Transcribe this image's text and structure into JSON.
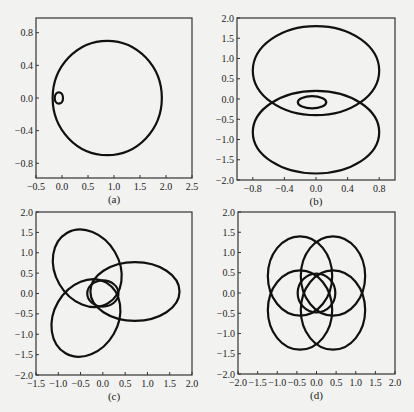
{
  "chart_data": [
    {
      "panel": "(a)",
      "type": "line",
      "title": "",
      "xlabel": "(a)",
      "ylabel": "",
      "xlim": [
        -0.5,
        2.5
      ],
      "ylim": [
        -0.98,
        0.98
      ],
      "xticks": [
        "-0.5",
        "0.0",
        "0.5",
        "1.0",
        "1.5",
        "2.0",
        "2.5"
      ],
      "yticks": [
        "0.8",
        "0.4",
        "0.0",
        "-0.4",
        "-0.8"
      ],
      "grid": false,
      "box": {
        "left": 36,
        "top": 18,
        "right": 192,
        "bottom": 178
      },
      "curves": [
        {
          "name": "outer-loop",
          "shape": "ellipse",
          "cx": 0.87,
          "cy": 0.0,
          "rx": 1.05,
          "ry": 0.7
        },
        {
          "name": "inner-loop",
          "shape": "ellipse",
          "cx": -0.06,
          "cy": 0.0,
          "rx": 0.08,
          "ry": 0.07
        }
      ]
    },
    {
      "panel": "(b)",
      "type": "line",
      "title": "",
      "xlabel": "(b)",
      "ylabel": "",
      "xlim": [
        -1.0,
        1.0
      ],
      "ylim": [
        -2.0,
        2.0
      ],
      "xticks": [
        "-0.8",
        "-0.4",
        "0.0",
        "0.4",
        "0.8"
      ],
      "yticks": [
        "2.0",
        "1.5",
        "1.0",
        "0.5",
        "0.0",
        "-0.5",
        "-1.0",
        "-1.5",
        "-2.0"
      ],
      "grid": false,
      "box": {
        "left": 237,
        "top": 18,
        "right": 395,
        "bottom": 180
      },
      "curves": [
        {
          "name": "upper-lobe",
          "shape": "ellipse",
          "cx": 0.0,
          "cy": 0.7,
          "rx": 0.8,
          "ry": 1.1
        },
        {
          "name": "lower-lobe",
          "shape": "ellipse",
          "cx": 0.0,
          "cy": -0.82,
          "rx": 0.8,
          "ry": 1.02
        },
        {
          "name": "inner-loop",
          "shape": "ellipse",
          "cx": -0.05,
          "cy": -0.08,
          "rx": 0.18,
          "ry": 0.15
        }
      ]
    },
    {
      "panel": "(c)",
      "type": "line",
      "title": "",
      "xlabel": "(c)",
      "ylabel": "",
      "xlim": [
        -1.5,
        2.0
      ],
      "ylim": [
        -2.0,
        2.0
      ],
      "xticks": [
        "-1.5",
        "-1.0",
        "-0.5",
        "0.0",
        "0.5",
        "1.0",
        "1.5",
        "2.0"
      ],
      "yticks": [
        "2.0",
        "1.5",
        "1.0",
        "0.5",
        "0.0",
        "-0.5",
        "-1.0",
        "-1.5",
        "-2.0"
      ],
      "grid": false,
      "box": {
        "left": 36,
        "top": 212,
        "right": 192,
        "bottom": 375
      },
      "curves": [
        {
          "name": "lobe-upper-left",
          "shape": "ellipse",
          "cx": -0.35,
          "cy": 0.62,
          "rx": 0.72,
          "ry": 1.0,
          "rotate": -30
        },
        {
          "name": "lobe-right",
          "shape": "ellipse",
          "cx": 0.72,
          "cy": 0.05,
          "rx": 1.0,
          "ry": 0.72,
          "rotate": 0
        },
        {
          "name": "lobe-lower-left",
          "shape": "ellipse",
          "cx": -0.38,
          "cy": -0.6,
          "rx": 0.72,
          "ry": 1.0,
          "rotate": 30
        },
        {
          "name": "inner-loop",
          "shape": "ellipse",
          "cx": 0.0,
          "cy": 0.0,
          "rx": 0.35,
          "ry": 0.32
        }
      ]
    },
    {
      "panel": "(d)",
      "type": "line",
      "title": "",
      "xlabel": "(d)",
      "ylabel": "",
      "xlim": [
        -2.0,
        2.0
      ],
      "ylim": [
        -2.0,
        2.0
      ],
      "xticks": [
        "-2.0",
        "-1.5",
        "-1.0",
        "-0.5",
        "0.0",
        "0.5",
        "1.0",
        "1.5",
        "2.0"
      ],
      "yticks": [
        "2.0",
        "1.5",
        "1.0",
        "0.5",
        "0.0",
        "-0.5",
        "-1.0",
        "-1.5",
        "-2.0"
      ],
      "grid": false,
      "box": {
        "left": 238,
        "top": 212,
        "right": 395,
        "bottom": 374
      },
      "curves": [
        {
          "name": "lobe-upper-left",
          "shape": "ellipse",
          "cx": -0.42,
          "cy": 0.42,
          "rx": 0.82,
          "ry": 0.98,
          "rotate": 0
        },
        {
          "name": "lobe-upper-right",
          "shape": "ellipse",
          "cx": 0.42,
          "cy": 0.42,
          "rx": 0.82,
          "ry": 0.98,
          "rotate": 0
        },
        {
          "name": "lobe-lower-left",
          "shape": "ellipse",
          "cx": -0.42,
          "cy": -0.42,
          "rx": 0.82,
          "ry": 0.98,
          "rotate": 0
        },
        {
          "name": "lobe-lower-right",
          "shape": "ellipse",
          "cx": 0.42,
          "cy": -0.42,
          "rx": 0.82,
          "ry": 0.98,
          "rotate": 0
        },
        {
          "name": "inner-loop",
          "shape": "ellipse",
          "cx": 0.0,
          "cy": 0.0,
          "rx": 0.48,
          "ry": 0.48
        }
      ]
    }
  ]
}
